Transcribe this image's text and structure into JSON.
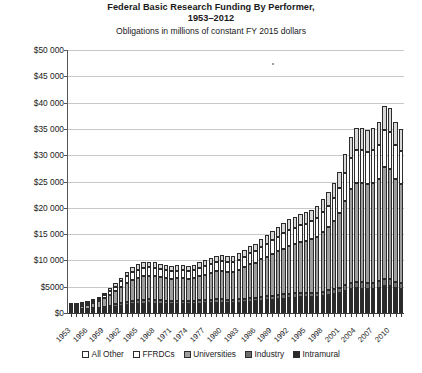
{
  "chart_data": {
    "type": "bar",
    "stacked": true,
    "title": "Federal Basic Research Funding By Performer, 1953–2012",
    "title_line1": "Federal Basic Research Funding By Performer,",
    "title_line2": "1953–2012",
    "subtitle": "Obligations in millions of constant FY 2015 dollars",
    "xlabel": "",
    "ylabel": "",
    "ylim": [
      0,
      50000
    ],
    "ytick_values": [
      0,
      5000,
      10000,
      15000,
      20000,
      25000,
      30000,
      35000,
      40000,
      45000,
      50000
    ],
    "ytick_labels": [
      "$0",
      "$5000",
      "$10 000",
      "$15 000",
      "$20 000",
      "$25 000",
      "$30 000",
      "$35 000",
      "$40 000",
      "$45 000",
      "$50 000"
    ],
    "grid": true,
    "legend_position": "bottom",
    "legend": [
      "All Other",
      "FFRDCs",
      "Universities",
      "Industry",
      "Intramural"
    ],
    "x": [
      1953,
      1954,
      1955,
      1956,
      1957,
      1958,
      1959,
      1960,
      1961,
      1962,
      1963,
      1964,
      1965,
      1966,
      1967,
      1968,
      1969,
      1970,
      1971,
      1972,
      1973,
      1974,
      1975,
      1976,
      1977,
      1978,
      1979,
      1980,
      1981,
      1982,
      1983,
      1984,
      1985,
      1986,
      1987,
      1988,
      1989,
      1990,
      1991,
      1992,
      1993,
      1994,
      1995,
      1996,
      1997,
      1998,
      1999,
      2000,
      2001,
      2002,
      2003,
      2004,
      2005,
      2006,
      2007,
      2008,
      2009,
      2010,
      2011,
      2012
    ],
    "xtick_labels": [
      "1953",
      "1956",
      "1959",
      "1962",
      "1965",
      "1968",
      "1971",
      "1974",
      "1977",
      "1980",
      "1983",
      "1986",
      "1989",
      "1992",
      "1995",
      "1998",
      "2001",
      "2004",
      "2007",
      "2010"
    ],
    "xtick_step": 3,
    "series": [
      {
        "name": "Intramural",
        "color": "#2a2a2a",
        "values": [
          300,
          330,
          360,
          420,
          520,
          640,
          800,
          950,
          1100,
          1300,
          1500,
          1650,
          1750,
          1800,
          1830,
          1800,
          1750,
          1700,
          1680,
          1700,
          1700,
          1680,
          1700,
          1800,
          1850,
          1900,
          1950,
          1950,
          1900,
          1900,
          1950,
          2050,
          2150,
          2200,
          2350,
          2450,
          2550,
          2650,
          2750,
          2850,
          2900,
          2950,
          2950,
          3000,
          3050,
          3200,
          3400,
          3600,
          3850,
          4250,
          4600,
          4700,
          4650,
          4600,
          4650,
          4800,
          5200,
          5100,
          4700,
          4500
        ]
      },
      {
        "name": "Industry",
        "color": "#6e6e6e",
        "values": [
          150,
          160,
          180,
          200,
          250,
          300,
          380,
          450,
          520,
          600,
          680,
          720,
          750,
          760,
          760,
          730,
          700,
          660,
          640,
          630,
          620,
          600,
          600,
          620,
          630,
          640,
          650,
          660,
          650,
          640,
          650,
          670,
          700,
          700,
          730,
          750,
          770,
          790,
          800,
          820,
          830,
          830,
          820,
          830,
          840,
          870,
          900,
          950,
          1000,
          1100,
          1200,
          1250,
          1200,
          1150,
          1150,
          1200,
          1350,
          1300,
          1200,
          1150
        ]
      },
      {
        "name": "Universities",
        "color": "#9e9e9e",
        "values": [
          400,
          470,
          560,
          700,
          950,
          1250,
          1700,
          2100,
          2500,
          3000,
          3500,
          3900,
          4200,
          4400,
          4500,
          4450,
          4350,
          4250,
          4200,
          4250,
          4300,
          4250,
          4350,
          4600,
          4800,
          5050,
          5300,
          5400,
          5300,
          5350,
          5600,
          6000,
          6400,
          6600,
          7100,
          7500,
          7900,
          8300,
          8700,
          9100,
          9400,
          9700,
          9900,
          10200,
          10600,
          11300,
          12100,
          13000,
          14200,
          16000,
          17800,
          18800,
          18900,
          18700,
          18900,
          19500,
          21200,
          21000,
          19600,
          18900
        ]
      },
      {
        "name": "FFRDCs",
        "color": "#fbfbfb",
        "values": [
          150,
          170,
          200,
          250,
          340,
          450,
          600,
          760,
          900,
          1100,
          1300,
          1450,
          1550,
          1600,
          1620,
          1600,
          1550,
          1500,
          1470,
          1480,
          1490,
          1470,
          1500,
          1580,
          1650,
          1730,
          1800,
          1840,
          1800,
          1810,
          1890,
          2020,
          2150,
          2220,
          2380,
          2510,
          2640,
          2770,
          2900,
          3030,
          3130,
          3230,
          3290,
          3390,
          3520,
          3750,
          4010,
          4310,
          4700,
          5300,
          5900,
          6230,
          6270,
          6200,
          6260,
          6460,
          7020,
          6960,
          6490,
          6260
        ]
      },
      {
        "name": "All Other",
        "color": "#d8d8d8",
        "values": [
          100,
          115,
          135,
          170,
          230,
          300,
          400,
          500,
          600,
          730,
          860,
          960,
          1030,
          1060,
          1070,
          1060,
          1030,
          990,
          970,
          980,
          985,
          970,
          990,
          1050,
          1090,
          1140,
          1190,
          1210,
          1190,
          1200,
          1250,
          1330,
          1420,
          1470,
          1570,
          1660,
          1740,
          1830,
          1910,
          2000,
          2060,
          2130,
          2170,
          2240,
          2320,
          2470,
          2650,
          2840,
          3100,
          3500,
          3900,
          4120,
          4140,
          4100,
          4140,
          4270,
          4640,
          4600,
          4290,
          4140
        ]
      }
    ]
  }
}
